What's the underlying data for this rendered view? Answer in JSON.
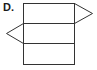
{
  "option_label": "D.",
  "diagram": {
    "type": "net-of-triangular-prism",
    "stroke_color": "#333333",
    "background": "#ffffff",
    "rectangles": [
      {
        "x": 23,
        "y": 3,
        "w": 51,
        "h": 20
      },
      {
        "x": 23,
        "y": 23,
        "w": 51,
        "h": 20
      },
      {
        "x": 23,
        "y": 43,
        "w": 51,
        "h": 21
      }
    ],
    "triangles": [
      {
        "side": "right",
        "points": "74,3 92,13 74,23"
      },
      {
        "side": "left",
        "points": "23,23 6,33 23,43"
      }
    ]
  }
}
